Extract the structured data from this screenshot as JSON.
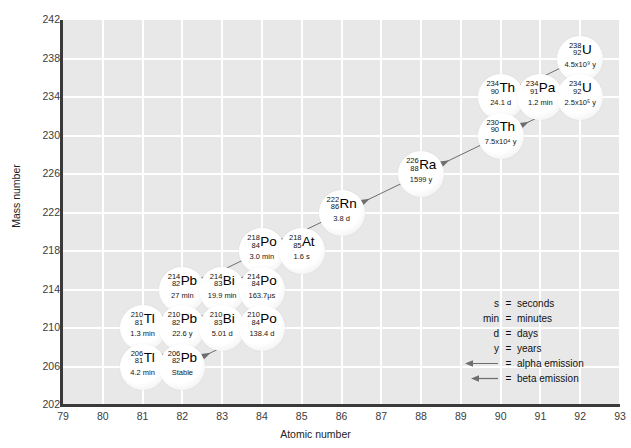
{
  "chart_data": {
    "type": "scatter",
    "title": "",
    "xlabel": "Atomic number",
    "ylabel": "Mass number",
    "xlim": [
      79,
      93
    ],
    "ylim": [
      202,
      242
    ],
    "xticks": [
      79,
      80,
      81,
      82,
      83,
      84,
      85,
      86,
      87,
      88,
      89,
      90,
      91,
      92,
      93
    ],
    "yticks": [
      202,
      206,
      210,
      214,
      218,
      222,
      226,
      230,
      234,
      238,
      242
    ],
    "grid": true,
    "legend_position": "inside-lower-right",
    "nuclides": [
      {
        "element": "U",
        "mass": "238",
        "z": "92",
        "half_life": "4.5x10⁹ y",
        "x": 92,
        "y": 238
      },
      {
        "element": "Th",
        "mass": "234",
        "z": "90",
        "half_life": "24.1 d",
        "x": 90,
        "y": 234
      },
      {
        "element": "Pa",
        "mass": "234",
        "z": "91",
        "half_life": "1.2 min",
        "x": 91,
        "y": 234
      },
      {
        "element": "U",
        "mass": "234",
        "z": "92",
        "half_life": "2.5x10⁵ y",
        "x": 92,
        "y": 234
      },
      {
        "element": "Th",
        "mass": "230",
        "z": "90",
        "half_life": "7.5x10⁴ y",
        "x": 90,
        "y": 230
      },
      {
        "element": "Ra",
        "mass": "226",
        "z": "88",
        "half_life": "1599 y",
        "x": 88,
        "y": 226
      },
      {
        "element": "Rn",
        "mass": "222",
        "z": "86",
        "half_life": "3.8 d",
        "x": 86,
        "y": 222
      },
      {
        "element": "Po",
        "mass": "218",
        "z": "84",
        "half_life": "3.0 min",
        "x": 84,
        "y": 218
      },
      {
        "element": "At",
        "mass": "218",
        "z": "85",
        "half_life": "1.6 s",
        "x": 85,
        "y": 218
      },
      {
        "element": "Pb",
        "mass": "214",
        "z": "82",
        "half_life": "27 min",
        "x": 82,
        "y": 214
      },
      {
        "element": "Bi",
        "mass": "214",
        "z": "83",
        "half_life": "19.9 min",
        "x": 83,
        "y": 214
      },
      {
        "element": "Po",
        "mass": "214",
        "z": "84",
        "half_life": "163.7μs",
        "x": 84,
        "y": 214
      },
      {
        "element": "Tl",
        "mass": "210",
        "z": "81",
        "half_life": "1.3 min",
        "x": 81,
        "y": 210
      },
      {
        "element": "Pb",
        "mass": "210",
        "z": "82",
        "half_life": "22.6 y",
        "x": 82,
        "y": 210
      },
      {
        "element": "Bi",
        "mass": "210",
        "z": "83",
        "half_life": "5.01 d",
        "x": 83,
        "y": 210
      },
      {
        "element": "Po",
        "mass": "210",
        "z": "84",
        "half_life": "138.4 d",
        "x": 84,
        "y": 210
      },
      {
        "element": "Tl",
        "mass": "206",
        "z": "81",
        "half_life": "4.2 min",
        "x": 81,
        "y": 206
      },
      {
        "element": "Pb",
        "mass": "206",
        "z": "82",
        "half_life": "Stable",
        "x": 82,
        "y": 206
      }
    ],
    "decays": [
      {
        "from": [
          92,
          238
        ],
        "to": [
          90,
          234
        ],
        "mode": "alpha",
        "style": "solid"
      },
      {
        "from": [
          90,
          234
        ],
        "to": [
          91,
          234
        ],
        "mode": "beta",
        "style": "solid"
      },
      {
        "from": [
          91,
          234
        ],
        "to": [
          92,
          234
        ],
        "mode": "beta",
        "style": "solid"
      },
      {
        "from": [
          92,
          234
        ],
        "to": [
          90,
          230
        ],
        "mode": "alpha",
        "style": "solid"
      },
      {
        "from": [
          90,
          230
        ],
        "to": [
          88,
          226
        ],
        "mode": "alpha",
        "style": "solid"
      },
      {
        "from": [
          88,
          226
        ],
        "to": [
          86,
          222
        ],
        "mode": "alpha",
        "style": "solid"
      },
      {
        "from": [
          86,
          222
        ],
        "to": [
          84,
          218
        ],
        "mode": "alpha",
        "style": "solid"
      },
      {
        "from": [
          84,
          218
        ],
        "to": [
          85,
          218
        ],
        "mode": "beta",
        "style": "solid"
      },
      {
        "from": [
          84,
          218
        ],
        "to": [
          82,
          214
        ],
        "mode": "alpha",
        "style": "solid"
      },
      {
        "from": [
          85,
          218
        ],
        "to": [
          83,
          214
        ],
        "mode": "alpha",
        "style": "dashed"
      },
      {
        "from": [
          82,
          214
        ],
        "to": [
          83,
          214
        ],
        "mode": "beta",
        "style": "solid"
      },
      {
        "from": [
          83,
          214
        ],
        "to": [
          84,
          214
        ],
        "mode": "beta",
        "style": "solid"
      },
      {
        "from": [
          83,
          214
        ],
        "to": [
          81,
          210
        ],
        "mode": "alpha",
        "style": "dashed"
      },
      {
        "from": [
          84,
          214
        ],
        "to": [
          82,
          210
        ],
        "mode": "alpha",
        "style": "solid"
      },
      {
        "from": [
          81,
          210
        ],
        "to": [
          82,
          210
        ],
        "mode": "beta",
        "style": "dashed"
      },
      {
        "from": [
          82,
          210
        ],
        "to": [
          83,
          210
        ],
        "mode": "beta",
        "style": "solid"
      },
      {
        "from": [
          83,
          210
        ],
        "to": [
          84,
          210
        ],
        "mode": "beta",
        "style": "solid"
      },
      {
        "from": [
          83,
          210
        ],
        "to": [
          81,
          206
        ],
        "mode": "alpha",
        "style": "dashed"
      },
      {
        "from": [
          84,
          210
        ],
        "to": [
          82,
          206
        ],
        "mode": "alpha",
        "style": "solid"
      },
      {
        "from": [
          81,
          206
        ],
        "to": [
          82,
          206
        ],
        "mode": "beta",
        "style": "solid"
      }
    ]
  },
  "legend": {
    "items": [
      {
        "key": "s",
        "value": "seconds",
        "type": "text"
      },
      {
        "key": "min",
        "value": "minutes",
        "type": "text"
      },
      {
        "key": "d",
        "value": "days",
        "type": "text"
      },
      {
        "key": "y",
        "value": "years",
        "type": "text"
      },
      {
        "key": "alpha-arrow",
        "value": "alpha emission",
        "type": "arrow"
      },
      {
        "key": "beta-arrow",
        "value": "beta emission",
        "type": "arrow"
      }
    ],
    "equals": "="
  },
  "colors": {
    "plot_background": "#e8e8e8",
    "gridline": "#ffffff",
    "axis": "#3a3a3a",
    "arrow": "#6e6e6e",
    "bubble": "#ffffff",
    "text": "#111111"
  }
}
